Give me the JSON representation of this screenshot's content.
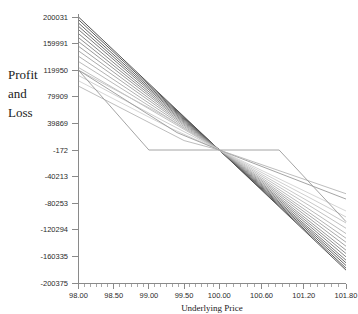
{
  "chart_data": {
    "type": "line",
    "title": "",
    "xlabel": "Underlying Price",
    "ylabel": "Profit and Loss",
    "xlim": [
      98.0,
      101.8
    ],
    "ylim": [
      -200375,
      200031
    ],
    "grid": false,
    "legend": false,
    "legend_position": "none",
    "x_tick_labels": [
      "98.00",
      "98.50",
      "99.00",
      "99.50",
      "100.00",
      "100.60",
      "101.20",
      "101.80"
    ],
    "x_tick_values": [
      98.0,
      98.5,
      99.0,
      99.5,
      100.0,
      100.6,
      101.2,
      101.8
    ],
    "x_minor_tick_count_between": 5,
    "y_tick_labels": [
      "200031",
      "159991",
      "119950",
      "79909",
      "39869",
      "-172",
      "-40213",
      "-80253",
      "-120294",
      "-160335",
      "-200375"
    ],
    "y_tick_values": [
      200031,
      159991,
      119950,
      79909,
      39869,
      -172,
      -40213,
      -80253,
      -120294,
      -160335,
      -200375
    ],
    "convergence_point": {
      "x": 100.0,
      "y": -172
    },
    "series": [
      {
        "name": "curve-1",
        "color": "#3f3f3f",
        "x": [
          98.0,
          100.0,
          101.8
        ],
        "y": [
          200031,
          -172,
          -181000
        ]
      },
      {
        "name": "curve-2",
        "color": "#4a4a4a",
        "x": [
          98.0,
          100.0,
          101.8
        ],
        "y": [
          196000,
          -172,
          -178000
        ]
      },
      {
        "name": "curve-3",
        "color": "#555555",
        "x": [
          98.0,
          100.0,
          101.8
        ],
        "y": [
          191000,
          -172,
          -174000
        ]
      },
      {
        "name": "curve-4",
        "color": "#5f5f5f",
        "x": [
          98.0,
          100.0,
          101.8
        ],
        "y": [
          186000,
          -172,
          -170000
        ]
      },
      {
        "name": "curve-5",
        "color": "#6b6b6b",
        "x": [
          98.0,
          100.0,
          101.8
        ],
        "y": [
          181000,
          -172,
          -166000
        ]
      },
      {
        "name": "curve-6",
        "color": "#767676",
        "x": [
          98.0,
          100.0,
          101.8
        ],
        "y": [
          175000,
          -172,
          -161000
        ]
      },
      {
        "name": "curve-7",
        "color": "#828282",
        "x": [
          98.0,
          100.0,
          101.8
        ],
        "y": [
          169000,
          -172,
          -156000
        ]
      },
      {
        "name": "curve-8",
        "color": "#8d8d8d",
        "x": [
          98.0,
          100.0,
          101.8
        ],
        "y": [
          163000,
          -172,
          -151000
        ]
      },
      {
        "name": "curve-9",
        "color": "#979797",
        "x": [
          98.0,
          100.0,
          101.8
        ],
        "y": [
          156000,
          -172,
          -145000
        ]
      },
      {
        "name": "curve-10",
        "color": "#a0a0a0",
        "x": [
          98.0,
          100.0,
          101.8
        ],
        "y": [
          149000,
          -172,
          -139000
        ]
      },
      {
        "name": "curve-11",
        "color": "#a9a9a9",
        "x": [
          98.0,
          100.0,
          101.8
        ],
        "y": [
          141000,
          -172,
          -133000
        ]
      },
      {
        "name": "curve-12",
        "color": "#b2b2b2",
        "x": [
          98.0,
          100.0,
          101.8
        ],
        "y": [
          133000,
          -172,
          -126000
        ]
      },
      {
        "name": "curve-13",
        "color": "#bababa",
        "x": [
          98.0,
          100.0,
          101.8
        ],
        "y": [
          124000,
          -172,
          -118000
        ]
      },
      {
        "name": "curve-14",
        "color": "#c2c2c2",
        "x": [
          98.0,
          99.2,
          100.0,
          101.8
        ],
        "y": [
          119950,
          52000,
          -172,
          -110000
        ]
      },
      {
        "name": "curve-15",
        "color": "#c9c9c9",
        "x": [
          98.0,
          99.2,
          100.0,
          101.8
        ],
        "y": [
          112000,
          44000,
          -172,
          -101000
        ]
      },
      {
        "name": "curve-16",
        "color": "#d0d0d0",
        "x": [
          98.0,
          99.3,
          100.0,
          101.8
        ],
        "y": [
          104000,
          33000,
          -172,
          -92000
        ]
      },
      {
        "name": "curve-17",
        "color": "#9a9a9a",
        "x": [
          98.0,
          99.4,
          100.0,
          101.8
        ],
        "y": [
          119950,
          26000,
          -172,
          -74000
        ]
      },
      {
        "name": "curve-18",
        "color": "#b6b6b6",
        "x": [
          98.0,
          99.5,
          100.0,
          101.8
        ],
        "y": [
          96000,
          14000,
          -172,
          -66000
        ]
      }
    ],
    "payoff_series": {
      "name": "expiry-payoff",
      "color": "#9a9a9a",
      "x": [
        98.0,
        99.0,
        100.85,
        101.8
      ],
      "y": [
        119950,
        -172,
        -172,
        -108000
      ]
    }
  }
}
